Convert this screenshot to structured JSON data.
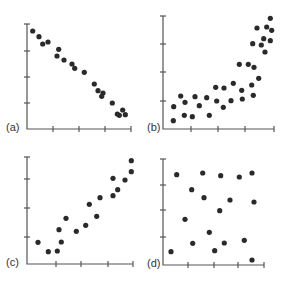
{
  "chart_data": [
    {
      "panel": "(a)",
      "type": "scatter",
      "title": "",
      "xlabel": "",
      "ylabel": "",
      "description": "strong negative linear relationship",
      "axis": {
        "x0": 27,
        "y0": 129,
        "x1": 131,
        "y1": 24,
        "xticks": [
          53,
          79,
          105,
          131
        ],
        "yticks": [
          24,
          51,
          77,
          103
        ]
      },
      "points": [
        [
          32.7,
          31
        ],
        [
          39,
          36.7
        ],
        [
          42.7,
          44
        ],
        [
          48,
          42
        ],
        [
          58.7,
          49.3
        ],
        [
          57,
          56
        ],
        [
          64,
          60
        ],
        [
          72,
          64
        ],
        [
          74.7,
          68.3
        ],
        [
          84.3,
          72.3
        ],
        [
          94.3,
          84
        ],
        [
          98,
          90.7
        ],
        [
          103,
          93
        ],
        [
          101.7,
          96.3
        ],
        [
          112.3,
          103
        ],
        [
          117.3,
          114
        ],
        [
          119.3,
          115.3
        ],
        [
          122.7,
          110
        ],
        [
          125.3,
          114.7
        ]
      ]
    },
    {
      "panel": "(b)",
      "type": "scatter",
      "title": "",
      "xlabel": "",
      "ylabel": "",
      "description": "positive curvilinear (exponential-like) relationship",
      "axis": {
        "x0": 163,
        "y0": 129,
        "x1": 274,
        "y1": 16,
        "xticks": [
          191,
          218,
          245,
          274
        ],
        "yticks": [
          16,
          44,
          72,
          101
        ]
      },
      "points": [
        [
          173.3,
          120.7
        ],
        [
          173.7,
          106.7
        ],
        [
          180.7,
          96
        ],
        [
          184.3,
          115.3
        ],
        [
          185,
          102.3
        ],
        [
          192.3,
          116.7
        ],
        [
          195,
          96.7
        ],
        [
          199.3,
          105.7
        ],
        [
          206.7,
          97.7
        ],
        [
          209.3,
          115.3
        ],
        [
          215.7,
          87.3
        ],
        [
          216.7,
          101
        ],
        [
          223.3,
          107.3
        ],
        [
          224,
          88
        ],
        [
          231,
          100.7
        ],
        [
          233.3,
          83.3
        ],
        [
          239.3,
          64.3
        ],
        [
          241.7,
          90.3
        ],
        [
          242.3,
          99
        ],
        [
          248.3,
          64.3
        ],
        [
          251.7,
          85
        ],
        [
          253.3,
          95.3
        ],
        [
          254,
          67.3
        ],
        [
          252.7,
          43.7
        ],
        [
          258.7,
          78.3
        ],
        [
          257,
          28
        ],
        [
          261.3,
          45
        ],
        [
          263.7,
          38.7
        ],
        [
          265,
          52
        ],
        [
          266.7,
          27
        ],
        [
          270.3,
          18.3
        ],
        [
          271.7,
          30.3
        ],
        [
          270.3,
          40.7
        ]
      ]
    },
    {
      "panel": "(c)",
      "type": "scatter",
      "title": "",
      "xlabel": "",
      "ylabel": "",
      "description": "positive linear relationship",
      "axis": {
        "x0": 27,
        "y0": 264,
        "x1": 133,
        "y1": 157,
        "xticks": [
          56,
          81,
          108,
          133
        ],
        "yticks": [
          157,
          179,
          208,
          237
        ]
      },
      "points": [
        [
          38,
          242.3
        ],
        [
          48.3,
          251.7
        ],
        [
          57.3,
          251
        ],
        [
          61.3,
          242
        ],
        [
          59,
          229.7
        ],
        [
          66,
          218.3
        ],
        [
          76.3,
          231.3
        ],
        [
          85.7,
          225.3
        ],
        [
          89.3,
          204.3
        ],
        [
          96.7,
          216.3
        ],
        [
          100,
          197.7
        ],
        [
          113,
          195.7
        ],
        [
          113,
          178.3
        ],
        [
          117.7,
          189.7
        ],
        [
          125,
          180
        ],
        [
          131.3,
          171.7
        ],
        [
          131.3,
          160.7
        ]
      ]
    },
    {
      "panel": "(d)",
      "type": "scatter",
      "title": "",
      "xlabel": "",
      "ylabel": "",
      "description": "no relationship",
      "axis": {
        "x0": 163,
        "y0": 265,
        "x1": 264,
        "y1": 159,
        "xticks": [
          188,
          214,
          238,
          264
        ],
        "yticks": [
          159,
          185,
          210,
          237
        ]
      },
      "points": [
        [
          176.7,
          174.7
        ],
        [
          202.7,
          173
        ],
        [
          220.7,
          175.7
        ],
        [
          239.3,
          177
        ],
        [
          252,
          173
        ],
        [
          191.7,
          189.7
        ],
        [
          204,
          197.7
        ],
        [
          230,
          200
        ],
        [
          254,
          202
        ],
        [
          219.7,
          210.7
        ],
        [
          185,
          219.3
        ],
        [
          209.3,
          232.3
        ],
        [
          192.7,
          243.3
        ],
        [
          224.3,
          243
        ],
        [
          244.3,
          240.3
        ],
        [
          171,
          251.7
        ],
        [
          214.7,
          250.7
        ],
        [
          252,
          260
        ]
      ]
    }
  ],
  "labels": {
    "a": "(a)",
    "b": "(b)",
    "c": "(c)",
    "d": "(d)"
  },
  "colors": {
    "axis": "#555555",
    "dot": "#2a2a2a",
    "background": "#ffffff"
  }
}
